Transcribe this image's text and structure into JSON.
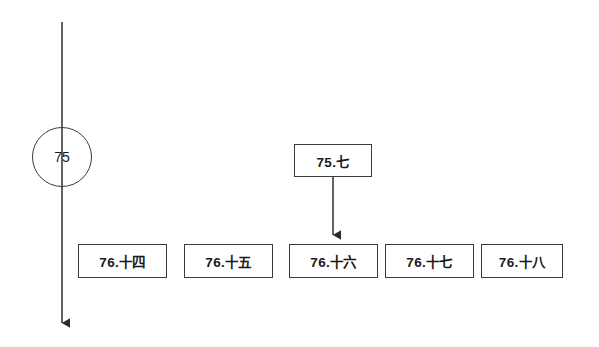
{
  "diagram": {
    "background_color": "#ffffff",
    "stroke_color": "#3b3b3b",
    "text_color": "#1a1a1a",
    "timeline": {
      "name": "vertical-timeline-arrow",
      "x": 62,
      "y_start": 22,
      "y_end": 332,
      "arrowhead": "down"
    },
    "circle_node": {
      "label": "75",
      "cx": 62,
      "cy": 157,
      "r": 30
    },
    "upper_node": {
      "label": "75.七",
      "x": 294,
      "y": 144,
      "width": 78,
      "height": 33
    },
    "connector_arrow": {
      "name": "downward-connector-arrow",
      "x": 333,
      "y_start": 177,
      "y_end": 244,
      "arrowhead": "down"
    },
    "row_nodes": [
      {
        "label": "76.十四",
        "x": 78,
        "y": 244,
        "width": 89,
        "height": 34
      },
      {
        "label": "76.十五",
        "x": 184,
        "y": 244,
        "width": 89,
        "height": 34
      },
      {
        "label": "76.十六",
        "x": 289,
        "y": 244,
        "width": 89,
        "height": 34
      },
      {
        "label": "76.十七",
        "x": 385,
        "y": 244,
        "width": 89,
        "height": 34
      },
      {
        "label": "76.十八",
        "x": 481,
        "y": 244,
        "width": 82,
        "height": 34
      }
    ]
  }
}
